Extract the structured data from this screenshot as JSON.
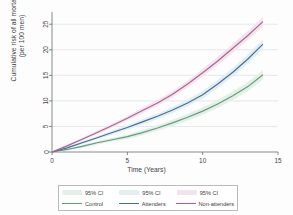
{
  "chart_data": {
    "type": "line",
    "title": "",
    "xlabel": "Time (Years)",
    "ylabel_line1": "Cumulative risk of all mortality",
    "ylabel_line2": "(per 100 men)",
    "xlim": [
      0,
      15
    ],
    "ylim": [
      0,
      27
    ],
    "xticks": [
      0,
      5,
      10,
      15
    ],
    "yticks": [
      0,
      5,
      10,
      15,
      20,
      25
    ],
    "xtick_labels": [
      "0",
      "5",
      "10",
      "15"
    ],
    "ytick_labels": [
      "0",
      "5",
      "10",
      "15",
      "20",
      "25"
    ],
    "grid": "horizontal",
    "legend_position": "below-plot",
    "x": [
      0,
      1,
      2,
      3,
      4,
      5,
      6,
      7,
      8,
      9,
      10,
      11,
      12,
      13,
      14
    ],
    "series": [
      {
        "name": "Control",
        "color": "#5f9c7e",
        "ci_color": "#e2f0e7",
        "ci_label": "95% CI",
        "values": [
          0,
          0.5,
          1.1,
          1.8,
          2.4,
          3.0,
          3.8,
          4.7,
          5.7,
          6.8,
          8.0,
          9.4,
          11.0,
          12.8,
          15.1
        ]
      },
      {
        "name": "Attenders",
        "color": "#3f6f9c",
        "ci_color": "#e2eef0",
        "ci_label": "95% CI",
        "values": [
          0,
          0.8,
          1.8,
          2.8,
          3.8,
          4.8,
          5.9,
          7.0,
          8.2,
          9.6,
          11.2,
          13.3,
          15.6,
          18.2,
          21.1
        ]
      },
      {
        "name": "Non-attenders",
        "color": "#b0628f",
        "ci_color": "#f2e3ef",
        "ci_label": "95% CI",
        "values": [
          0,
          1.2,
          2.5,
          3.8,
          5.2,
          6.6,
          8.1,
          9.6,
          11.3,
          13.3,
          15.5,
          17.8,
          20.3,
          22.8,
          25.5
        ]
      }
    ]
  },
  "legend": {
    "rows": [
      [
        {
          "kind": "ci",
          "label": "95% CI"
        },
        {
          "kind": "ci",
          "label": "95% CI"
        },
        {
          "kind": "ci",
          "label": "95% CI"
        }
      ],
      [
        {
          "kind": "line",
          "label": "Control"
        },
        {
          "kind": "line",
          "label": "Attenders"
        },
        {
          "kind": "line",
          "label": "Non-attenders"
        }
      ]
    ]
  }
}
